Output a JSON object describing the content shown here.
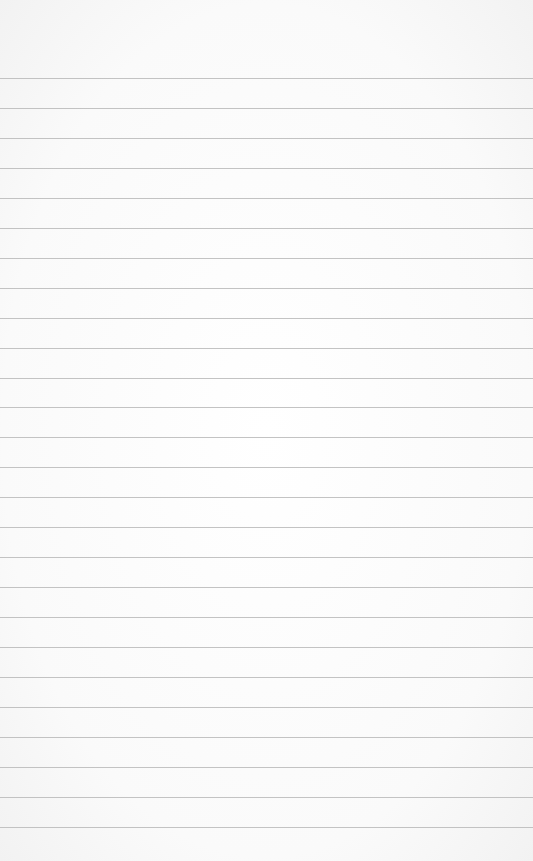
{
  "paper": {
    "type": "lined-paper",
    "background_color": "#fbfbfb",
    "rule_color": "#b9b9b9",
    "first_rule_y": 78,
    "rule_spacing": 29.95,
    "rule_count": 26
  }
}
